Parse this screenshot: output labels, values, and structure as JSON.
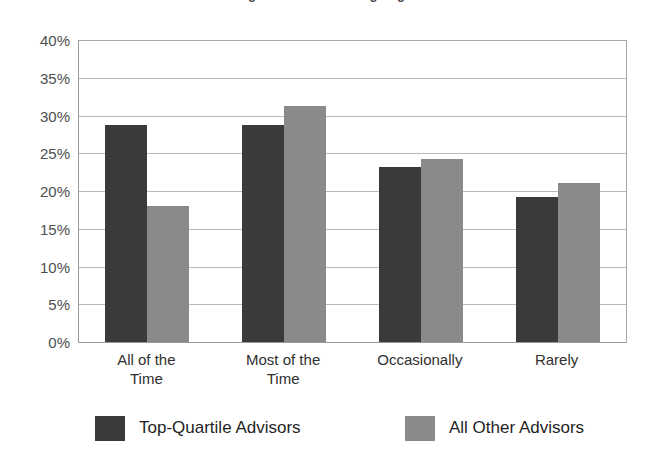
{
  "chart_data": {
    "type": "bar",
    "title": "Percentage of Advisors Using Segmentation",
    "subtitle": "",
    "xlabel": "",
    "ylabel": "",
    "ylim": [
      0,
      40
    ],
    "ytick_step": 5,
    "ytick_labels": [
      "40%",
      "35%",
      "30%",
      "25%",
      "20%",
      "15%",
      "10%",
      "5%",
      "0%"
    ],
    "ytick_values": [
      40,
      35,
      30,
      25,
      20,
      15,
      10,
      5,
      0
    ],
    "grid": true,
    "legend_position": "bottom",
    "categories": [
      "All of the Time",
      "Most of the Time",
      "Occasionally",
      "Rarely"
    ],
    "category_lines": [
      [
        "All of the",
        "Time"
      ],
      [
        "Most of the",
        "Time"
      ],
      [
        "Occasionally"
      ],
      [
        "Rarely"
      ]
    ],
    "series": [
      {
        "name": "Top-Quartile Advisors",
        "color": "#3a3a3a",
        "values": [
          28.8,
          28.8,
          23.2,
          19.2
        ]
      },
      {
        "name": "All Other Advisors",
        "color": "#8a8a8a",
        "values": [
          18.0,
          31.3,
          24.2,
          21.0
        ]
      }
    ]
  },
  "axis": {
    "axis_line_color": "#9a9a9a",
    "gridline_color": "#b9b9b9"
  }
}
